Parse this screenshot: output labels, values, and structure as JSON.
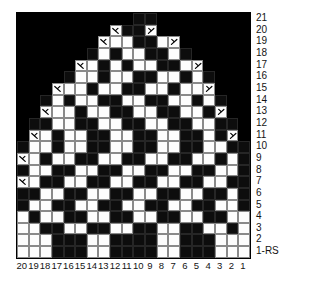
{
  "chart": {
    "columns": 20,
    "rows": 21,
    "colors": {
      "knit": "#0d0d0d",
      "purl": "#fdfdfd",
      "outside": "#000000",
      "gridline": "#8a8a8a",
      "text": "#141414"
    },
    "legend_note": "1-RS",
    "row_labels": [
      "21",
      "20",
      "19",
      "18",
      "17",
      "16",
      "15",
      "14",
      "13",
      "12",
      "11",
      "10",
      "9",
      "8",
      "7",
      "6",
      "5",
      "4",
      "3",
      "2",
      "1-RS"
    ],
    "column_labels": [
      "20",
      "19",
      "18",
      "17",
      "16",
      "15",
      "14",
      "13",
      "12",
      "11",
      "10",
      "9",
      "8",
      "7",
      "6",
      "5",
      "4",
      "3",
      "2",
      "1"
    ],
    "symbols": {
      "left_decrease": "ssk-decrease-icon",
      "right_decrease": "k2tog-decrease-icon"
    },
    "cell_codes": {
      "o": "outside-chart",
      "k": "knit-dark-stitch",
      "p": "purl-light-stitch",
      "L": "purl-light-stitch-with-left-decrease",
      "R": "purl-light-stitch-with-right-decrease"
    },
    "grid": [
      "ooooooooookkoooooooo",
      "ooooooooLkkRoooooooo",
      "oooooooLppkkpRoooooo",
      "ooooookpkppkkpkooooo",
      "oooooLpkpkppkkpRoooo",
      "ooookppkppkkppkpkooo",
      "oooLppkppkkppkppRooo",
      "ookpkppkkppkkppkpkoo",
      "ooLppkppkkppkkppkRoo",
      "okkppkkppkkppkkppkko",
      "oLpkppkkppkkppkkpkRo",
      "kppkppkkppkkppkkppkk",
      "Lpkppkkppkkppkkppkpk",
      "kppkkppkkppkkppkkppk",
      "Lpkkppkkppkkppkkppkk",
      "kkppkkppkkppkkppkkpk",
      "kppkkppkkppkkppkkppk",
      "pkppkkppkkppkkppkkpp",
      "ppkkppkkppkkppkkppkp",
      "pppkkkppkkkkppkkkppp",
      "pppkkkppkkkkppkkkppp"
    ]
  }
}
